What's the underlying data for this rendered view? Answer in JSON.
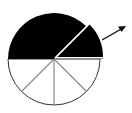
{
  "diagram": {
    "type": "fraction-circle",
    "colors": {
      "shaded": "#000000",
      "unshaded": "#ffffff",
      "divider": "#888888",
      "outline": "#333333"
    },
    "sectors": [
      {
        "start_deg": 0,
        "end_deg": 45,
        "fill": "shaded",
        "detached": true
      },
      {
        "start_deg": 45,
        "end_deg": 180,
        "fill": "shaded",
        "detached": false
      },
      {
        "start_deg": 180,
        "end_deg": 225,
        "fill": "unshaded"
      },
      {
        "start_deg": 225,
        "end_deg": 270,
        "fill": "unshaded"
      },
      {
        "start_deg": 270,
        "end_deg": 315,
        "fill": "unshaded"
      },
      {
        "start_deg": 315,
        "end_deg": 360,
        "fill": "unshaded"
      }
    ],
    "arrow": {
      "direction": "outward-up-right",
      "icon": "arrow-icon"
    }
  }
}
